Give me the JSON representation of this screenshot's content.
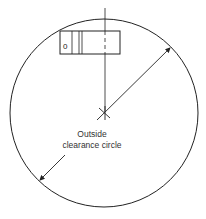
{
  "diagram": {
    "type": "clearance-circle",
    "label_lines": [
      "Outside",
      "clearance circle"
    ],
    "component_marker": "0",
    "colors": {
      "stroke": "#222222",
      "text": "#333333",
      "background": "#ffffff"
    }
  }
}
